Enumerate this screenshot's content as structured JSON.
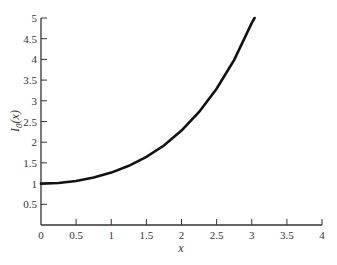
{
  "chart_data": {
    "type": "line",
    "title": "",
    "xlabel": "x",
    "ylabel": "I0(x)",
    "ylabel_main": "I",
    "ylabel_sub": "0",
    "ylabel_tail": "(x)",
    "xlim": [
      0,
      4
    ],
    "ylim": [
      0,
      5
    ],
    "grid": false,
    "legend": null,
    "x_ticks": [
      0,
      0.5,
      1,
      1.5,
      2,
      2.5,
      3,
      3.5,
      4
    ],
    "x_tick_labels": [
      "0",
      "0.5",
      "1",
      "1.5",
      "2",
      "2.5",
      "3",
      "3.5",
      "4"
    ],
    "y_ticks": [
      0.5,
      1,
      1.5,
      2,
      2.5,
      3,
      3.5,
      4,
      4.5,
      5
    ],
    "y_tick_labels": [
      "0.5",
      "1",
      "1.5",
      "2",
      "2.5",
      "3",
      "3.5",
      "4",
      "4.5",
      "5"
    ],
    "series": [
      {
        "name": "I0(x)",
        "color": "#111111",
        "x": [
          0,
          0.25,
          0.5,
          0.75,
          1,
          1.25,
          1.5,
          1.75,
          2,
          2.25,
          2.5,
          2.75,
          3,
          3.04
        ],
        "y": [
          1.0,
          1.0157,
          1.0635,
          1.1456,
          1.2661,
          1.4296,
          1.6467,
          1.9196,
          2.2796,
          2.7306,
          3.2898,
          3.987,
          4.8808,
          5.0
        ]
      }
    ]
  }
}
